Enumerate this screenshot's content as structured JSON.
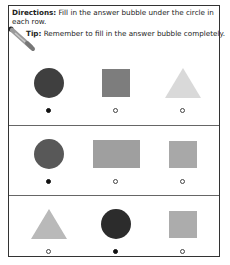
{
  "header": {
    "directions_label": "Directions:",
    "directions_text": " Fill in the answer bubble under the circle in each row.",
    "tip_label": "Tip:",
    "tip_text": " Remember to fill in the answer bubble completely."
  },
  "colors": {
    "border": "#333333",
    "divider": "#666666",
    "dark_circle": "#3a3a3a",
    "medium_circle": "#555555",
    "square_dark": "#7a7a7a",
    "square_light": "#a9a9a9",
    "rectangle": "#9e9e9e",
    "triangle_light": "#d9d9d9",
    "triangle_medium": "#b8b8b8",
    "bubble_filled": "#111111"
  },
  "rows": [
    {
      "items": [
        {
          "shape": "circle",
          "color": "#3f3f3f",
          "selected": true
        },
        {
          "shape": "square",
          "color": "#7d7d7d",
          "selected": false
        },
        {
          "shape": "triangle",
          "color": "#d9d9d9",
          "selected": false
        }
      ]
    },
    {
      "items": [
        {
          "shape": "circle",
          "color": "#585858",
          "selected": true
        },
        {
          "shape": "rectangle",
          "color": "#9f9f9f",
          "selected": false
        },
        {
          "shape": "square",
          "color": "#a8a8a8",
          "selected": false
        }
      ]
    },
    {
      "items": [
        {
          "shape": "triangle",
          "color": "#b9b9b9",
          "selected": false
        },
        {
          "shape": "circle",
          "color": "#2c2c2c",
          "selected": true
        },
        {
          "shape": "square",
          "color": "#acacac",
          "selected": false
        }
      ]
    }
  ]
}
